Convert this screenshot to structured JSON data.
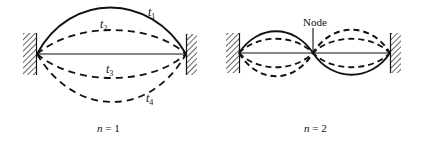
{
  "figure": {
    "panels": [
      {
        "id": "fundamental",
        "caption": "n = 1",
        "caption_var": "n",
        "caption_value": "1",
        "curves": [
          {
            "label": "t",
            "subscript": "1",
            "style": "solid"
          },
          {
            "label": "t",
            "subscript": "2",
            "style": "dashed"
          },
          {
            "label": "",
            "subscript": "",
            "style": "solid-straight"
          },
          {
            "label": "t",
            "subscript": "3",
            "style": "dashed"
          },
          {
            "label": "t",
            "subscript": "4",
            "style": "dashed"
          }
        ]
      },
      {
        "id": "second-harmonic",
        "caption": "n = 2",
        "caption_var": "n",
        "caption_value": "2",
        "node_label": "Node"
      }
    ],
    "colors": {
      "ink": "#111111",
      "background": "#ffffff"
    }
  }
}
